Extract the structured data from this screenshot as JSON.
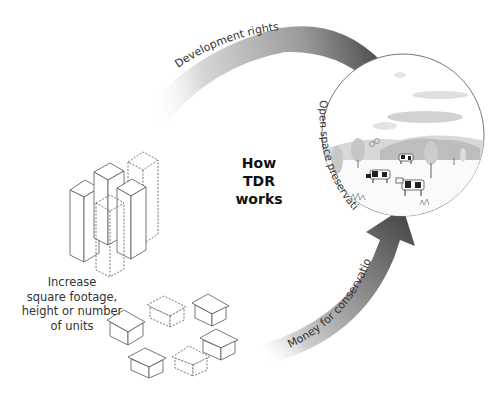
{
  "diagram": {
    "title_lines": [
      "How",
      "TDR",
      "works"
    ],
    "flows": {
      "top_arrow_label": "Development rights",
      "circle_label": "Open space preservation",
      "bottom_arrow_label": "Money for conservation"
    },
    "sending_area": {
      "description": "Rural open space with cows, trees and hills"
    },
    "receiving_area": {
      "label_lines": [
        "Increase",
        "square footage,",
        "height or number",
        "of units"
      ],
      "elements": [
        "towers",
        "houses"
      ]
    },
    "colors": {
      "arrow_dark": "#4a4a4a",
      "arrow_light": "#e6e6e6",
      "line": "#555555",
      "circle_stroke": "#777777"
    }
  }
}
